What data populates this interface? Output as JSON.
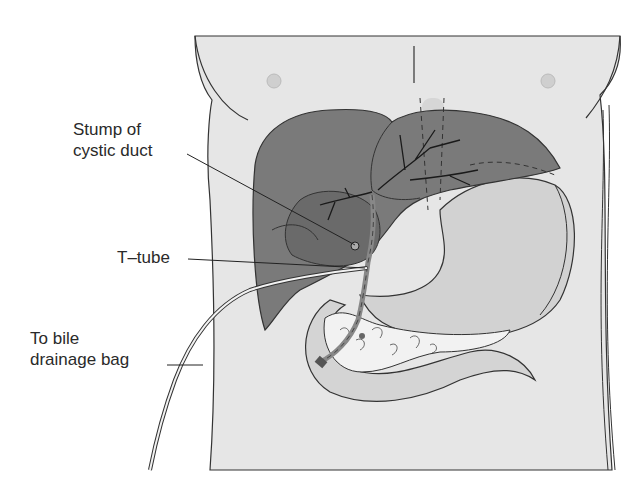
{
  "diagram": {
    "type": "anatomical-illustration",
    "labels": {
      "cystic_stump": {
        "line1": "Stump of",
        "line2": "cystic duct"
      },
      "t_tube": {
        "text": "T–tube"
      },
      "drainage": {
        "line1": "To bile",
        "line2": "drainage bag"
      }
    },
    "structures": [
      "torso",
      "liver",
      "stomach",
      "duodenum",
      "pancreas",
      "common bile duct",
      "T-tube",
      "drainage tubing"
    ],
    "colors": {
      "background": "#ffffff",
      "torso": "#e6e6e6",
      "liver": "#7a7a7a",
      "liver_dark": "#6a6a6a",
      "stomach": "#d2d2d2",
      "outline": "#333333",
      "text": "#2a2a2a"
    }
  }
}
